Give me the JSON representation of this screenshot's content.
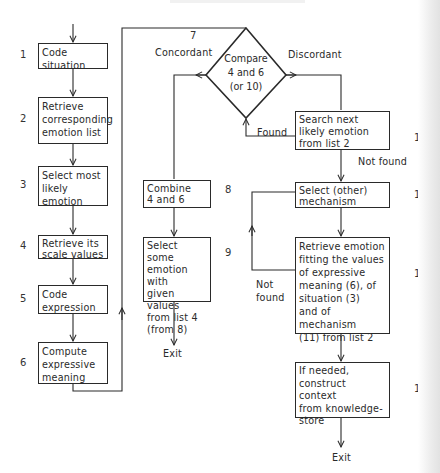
{
  "figure": {
    "type": "flowchart",
    "colors": {
      "stroke": "#2a2a2a",
      "background": "#ffffff"
    }
  },
  "steps": {
    "s1": {
      "number": "1",
      "text": "Code\nsituation"
    },
    "s2": {
      "number": "2",
      "text": "Retrieve\ncorresponding\nemotion list"
    },
    "s3": {
      "number": "3",
      "text": "Select most\nlikely\nemotion"
    },
    "s4": {
      "number": "4",
      "text": "Retrieve its\nscale values"
    },
    "s5": {
      "number": "5",
      "text": "Code\nexpression"
    },
    "s6": {
      "number": "6",
      "text": "Compute\nexpressive\nmeaning"
    },
    "s7": {
      "number": "7",
      "text": "Compare\n4 and 6\n(or 10)"
    },
    "s8": {
      "number": "8",
      "text": "Combine\n4 and 6"
    },
    "s9": {
      "number": "9",
      "text": "Select some\nemotion with\ngiven values\nfrom list 4\n(from 8)"
    },
    "s10": {
      "number": "10",
      "text": "Search next\nlikely emotion\nfrom list 2"
    },
    "s11": {
      "number": "11",
      "text": "Select (other)\nmechanism"
    },
    "s12": {
      "number": "12",
      "text": "Retrieve emotion\nfitting the values\nof expressive\nmeaning (6), of\nsituation (3)\nand of mechanism\n(11) from list 2"
    },
    "s13": {
      "number": "13",
      "text": "If needed,\nconstruct context\nfrom knowledge-\nstore"
    }
  },
  "edge_labels": {
    "concordant": "Concordant",
    "discordant": "Discordant",
    "found": "Found",
    "not_found_10": "Not found",
    "not_found_12": "Not\nfound",
    "exit_9": "Exit",
    "exit_13": "Exit"
  }
}
